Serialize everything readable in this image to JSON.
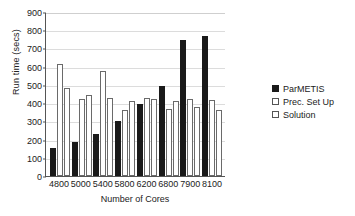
{
  "chart_data": {
    "type": "bar",
    "title": "",
    "subtitle": "",
    "xlabel": "Number of Cores",
    "ylabel": "Run time (secs)",
    "categories": [
      "4800",
      "5000",
      "5400",
      "5800",
      "6200",
      "6800",
      "7900",
      "8100"
    ],
    "series": [
      {
        "name": "ParMETIS",
        "color": "#1a1a1a",
        "fill": "solid",
        "values": [
          155,
          185,
          230,
          303,
          395,
          495,
          747,
          770
        ]
      },
      {
        "name": "Prec. Set Up",
        "color": "#ffffff",
        "fill": "outlined",
        "values": [
          615,
          420,
          578,
          360,
          428,
          368,
          425,
          415
        ]
      },
      {
        "name": "Solution",
        "color": "#ffffff",
        "fill": "outlined",
        "values": [
          482,
          447,
          430,
          413,
          423,
          412,
          380,
          362
        ]
      }
    ],
    "ylim": [
      0,
      900
    ],
    "ytick_step": 100,
    "yticks": [
      0,
      100,
      200,
      300,
      400,
      500,
      600,
      700,
      800,
      900
    ],
    "grid": true,
    "grid_axis": "y",
    "legend": true,
    "legend_position": "right",
    "legend_clipped_text": "Prec. Set Up"
  },
  "axes": {
    "y_title": "Run time (secs)",
    "x_title": "Number of Cores"
  },
  "colors": {
    "series_filled": "#1a1a1a",
    "series_outline": "#6a6a6a",
    "gridline": "#dcdcdc",
    "axis": "#555555",
    "background": "#ffffff",
    "text": "#222222"
  }
}
